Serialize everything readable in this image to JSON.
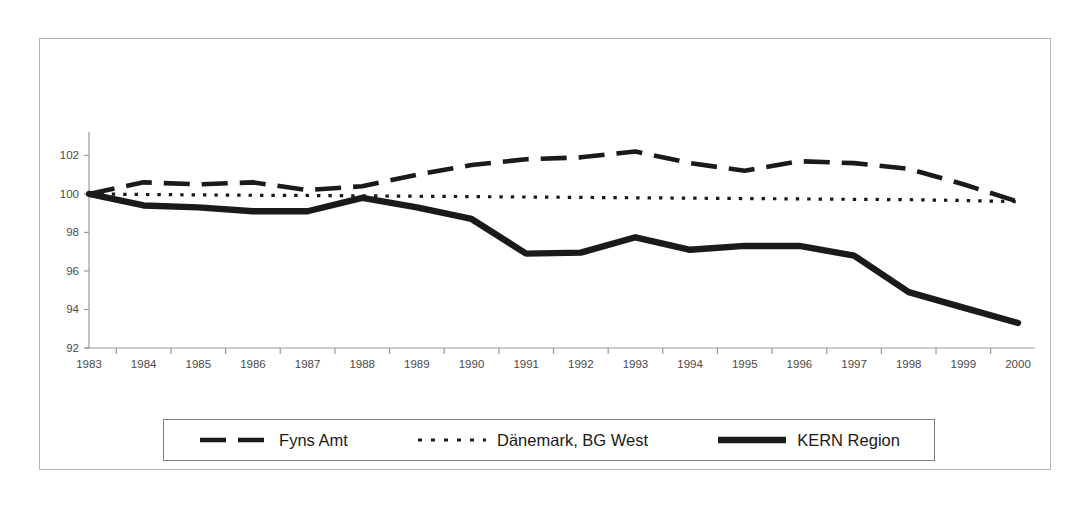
{
  "figure": {
    "background_color": "#ffffff",
    "frame_color": "#b5b5b5",
    "line_color": "#1a1a1a",
    "axis_color": "#9a9a9a",
    "tick_label_color": "#4a4a4a"
  },
  "legend": {
    "position": "bottom",
    "border_color": "#7a7a7a",
    "entries": [
      {
        "label": "Fyns Amt",
        "style": "dashed",
        "icon": "legend-line-dashed"
      },
      {
        "label": "Dänemark, BG West",
        "style": "dotted",
        "icon": "legend-line-dotted"
      },
      {
        "label": "KERN Region",
        "style": "solid-thick",
        "icon": "legend-line-solid"
      }
    ]
  },
  "chart_data": {
    "type": "line",
    "title": "",
    "subtitle": "",
    "xlabel": "",
    "ylabel": "",
    "categories": [
      "1983",
      "1984",
      "1985",
      "1986",
      "1987",
      "1988",
      "1989",
      "1990",
      "1991",
      "1992",
      "1993",
      "1994",
      "1995",
      "1996",
      "1997",
      "1998",
      "1999",
      "2000"
    ],
    "x": [
      1983,
      1984,
      1985,
      1986,
      1987,
      1988,
      1989,
      1990,
      1991,
      1992,
      1993,
      1994,
      1995,
      1996,
      1997,
      1998,
      1999,
      2000
    ],
    "ylim": [
      92,
      102.8
    ],
    "xlim": [
      1983,
      2000
    ],
    "yticks": [
      92,
      94,
      96,
      98,
      100,
      102
    ],
    "ytick_labels": [
      "92",
      "94",
      "96",
      "98",
      "100",
      "102"
    ],
    "grid": false,
    "legend_position": "bottom",
    "series": [
      {
        "name": "Fyns Amt",
        "style": "dashed",
        "color": "#1a1a1a",
        "values": [
          100.0,
          100.6,
          100.5,
          100.6,
          100.2,
          100.4,
          101.0,
          101.5,
          101.8,
          101.9,
          102.2,
          101.6,
          101.2,
          101.7,
          101.6,
          101.3,
          100.5,
          99.6
        ]
      },
      {
        "name": "Dänemark, BG West",
        "style": "dotted",
        "color": "#1a1a1a",
        "values": [
          100.0,
          99.97,
          99.95,
          99.93,
          99.92,
          99.9,
          99.88,
          99.86,
          99.84,
          99.82,
          99.8,
          99.78,
          99.76,
          99.74,
          99.72,
          99.7,
          99.66,
          99.6
        ]
      },
      {
        "name": "KERN Region",
        "style": "solid-thick",
        "color": "#1a1a1a",
        "values": [
          100.0,
          99.4,
          99.3,
          99.1,
          99.1,
          99.8,
          99.3,
          98.7,
          96.9,
          96.95,
          97.75,
          97.1,
          97.3,
          97.3,
          96.8,
          94.9,
          94.1,
          93.3
        ]
      }
    ]
  }
}
